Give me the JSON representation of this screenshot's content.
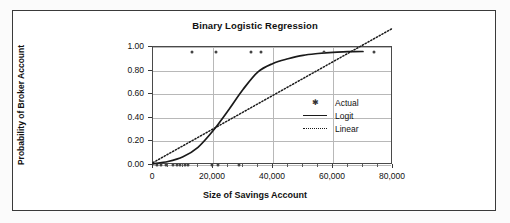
{
  "chart_data": {
    "type": "scatter",
    "title": "Binary Logistic Regression",
    "xlabel": "Size of Savings Account",
    "ylabel": "Probability of Broker Account",
    "xlim": [
      0,
      80000
    ],
    "ylim": [
      0.0,
      1.0
    ],
    "grid": true,
    "legend_position": "center-right",
    "xticks": [
      0,
      20000,
      40000,
      60000,
      80000
    ],
    "xtick_labels": [
      "0",
      "20,000",
      "40,000",
      "60,000",
      "80,000"
    ],
    "yticks": [
      0.0,
      0.2,
      0.4,
      0.6,
      0.8,
      1.0
    ],
    "ytick_labels": [
      "0.00",
      "0.20",
      "0.40",
      "0.60",
      "0.80",
      "1.00"
    ],
    "series": [
      {
        "name": "Actual",
        "type": "scatter",
        "marker": "asterisk",
        "color": "#444444",
        "points": [
          [
            1200,
            0.0
          ],
          [
            2600,
            0.0
          ],
          [
            4200,
            0.0
          ],
          [
            6500,
            0.0
          ],
          [
            8000,
            0.0
          ],
          [
            9000,
            0.0
          ],
          [
            10500,
            0.0
          ],
          [
            11500,
            0.0
          ],
          [
            19500,
            0.0
          ],
          [
            21500,
            0.0
          ],
          [
            28500,
            0.0
          ],
          [
            13000,
            0.96
          ],
          [
            21000,
            0.96
          ],
          [
            32500,
            0.96
          ],
          [
            36000,
            0.96
          ],
          [
            57000,
            0.96
          ],
          [
            73500,
            0.96
          ]
        ]
      },
      {
        "name": "Logit",
        "type": "line",
        "style": "solid",
        "color": "#1a1a1a",
        "x": [
          0,
          5000,
          10000,
          15000,
          20000,
          25000,
          30000,
          35000,
          40000,
          45000,
          50000,
          55000,
          60000,
          65000,
          70000
        ],
        "y": [
          0.01,
          0.03,
          0.07,
          0.15,
          0.29,
          0.46,
          0.64,
          0.79,
          0.86,
          0.9,
          0.93,
          0.945,
          0.955,
          0.96,
          0.962
        ]
      },
      {
        "name": "Linear",
        "type": "line",
        "style": "dotted",
        "color": "#1a1a1a",
        "x": [
          0,
          80000
        ],
        "y": [
          0.02,
          1.16
        ]
      }
    ]
  },
  "legend": {
    "items": [
      {
        "label": "Actual",
        "key": "asterisk-marker"
      },
      {
        "label": "Logit",
        "key": "solid-line"
      },
      {
        "label": "Linear",
        "key": "dotted-line"
      }
    ]
  }
}
